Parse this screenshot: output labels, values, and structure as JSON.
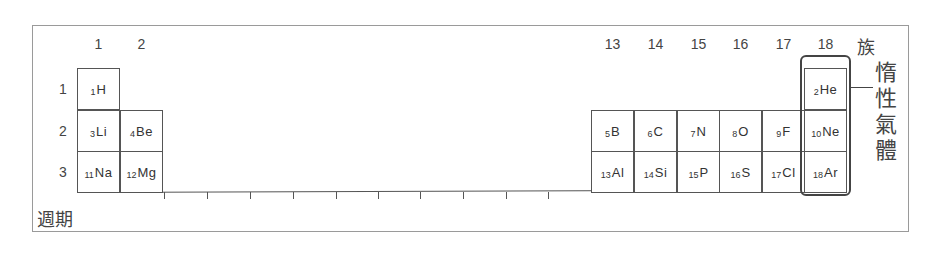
{
  "figure": {
    "axis_labels": {
      "group": "族",
      "period": "週期"
    },
    "group_numbers": [
      "1",
      "2",
      "13",
      "14",
      "15",
      "16",
      "17",
      "18"
    ],
    "period_numbers": [
      "1",
      "2",
      "3"
    ],
    "noble_gas_label": [
      "惰",
      "性",
      "氣",
      "體"
    ],
    "elements": [
      {
        "z": "1",
        "symbol": "H",
        "group": 1,
        "period": 1
      },
      {
        "z": "3",
        "symbol": "Li",
        "group": 1,
        "period": 2
      },
      {
        "z": "4",
        "symbol": "Be",
        "group": 2,
        "period": 2
      },
      {
        "z": "11",
        "symbol": "Na",
        "group": 1,
        "period": 3
      },
      {
        "z": "12",
        "symbol": "Mg",
        "group": 2,
        "period": 3
      },
      {
        "z": "5",
        "symbol": "B",
        "group": 13,
        "period": 2
      },
      {
        "z": "6",
        "symbol": "C",
        "group": 14,
        "period": 2
      },
      {
        "z": "7",
        "symbol": "N",
        "group": 15,
        "period": 2
      },
      {
        "z": "8",
        "symbol": "O",
        "group": 16,
        "period": 2
      },
      {
        "z": "9",
        "symbol": "F",
        "group": 17,
        "period": 2
      },
      {
        "z": "13",
        "symbol": "Al",
        "group": 13,
        "period": 3
      },
      {
        "z": "14",
        "symbol": "Si",
        "group": 14,
        "period": 3
      },
      {
        "z": "15",
        "symbol": "P",
        "group": 15,
        "period": 3
      },
      {
        "z": "16",
        "symbol": "S",
        "group": 16,
        "period": 3
      },
      {
        "z": "17",
        "symbol": "Cl",
        "group": 17,
        "period": 3
      },
      {
        "z": "2",
        "symbol": "He",
        "group": 18,
        "period": 1
      },
      {
        "z": "10",
        "symbol": "Ne",
        "group": 18,
        "period": 2
      },
      {
        "z": "18",
        "symbol": "Ar",
        "group": 18,
        "period": 3
      }
    ],
    "colors": {
      "line": "#555555",
      "frame": "#9a9a9a",
      "text": "#333333"
    }
  }
}
